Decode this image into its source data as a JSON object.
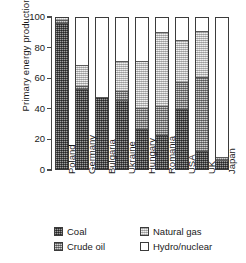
{
  "chart_data": {
    "type": "bar",
    "subtype": "stacked-bar-100",
    "title": "",
    "xlabel": "",
    "ylabel": "Primary energy production (%)",
    "ylim": [
      0,
      100
    ],
    "yticks": [
      0,
      20,
      40,
      60,
      80,
      100
    ],
    "ytick_labels": [
      "0",
      "20",
      "40",
      "60",
      "80",
      "100"
    ],
    "grid": false,
    "legend_position": "bottom",
    "categories": [
      "Poland",
      "Germany",
      "Bulgaria",
      "Ukraine",
      "Hungary",
      "Romania",
      "USA",
      "UK",
      "Japan"
    ],
    "series": [
      {
        "name": "Coal",
        "values": [
          96,
          52,
          47,
          45,
          26,
          22,
          39,
          11,
          5
        ]
      },
      {
        "name": "Crude oil",
        "values": [
          2,
          2,
          0,
          6,
          14,
          19,
          18,
          49,
          2
        ]
      },
      {
        "name": "Natural gas",
        "values": [
          2,
          14,
          0,
          20,
          31,
          49,
          28,
          31,
          0
        ]
      },
      {
        "name": "Hydro/nuclear",
        "values": [
          0,
          32,
          53,
          29,
          29,
          10,
          15,
          9,
          93
        ]
      }
    ],
    "cumulative_tops": {
      "Poland": [
        96,
        98,
        100,
        100
      ],
      "Germany": [
        52,
        54,
        68,
        100
      ],
      "Bulgaria": [
        47,
        47,
        47,
        100
      ],
      "Ukraine": [
        45,
        51,
        71,
        100
      ],
      "Hungary": [
        26,
        40,
        71,
        100
      ],
      "Romania": [
        22,
        41,
        90,
        100
      ],
      "USA": [
        39,
        57,
        85,
        100
      ],
      "UK": [
        11,
        60,
        91,
        100
      ],
      "Japan": [
        5,
        7,
        7,
        100
      ]
    }
  },
  "legend": {
    "entries": [
      {
        "label": "Coal",
        "pattern": "dense-dark-dither",
        "swatch_color": "#545454"
      },
      {
        "label": "Crude oil",
        "pattern": "medium-grey-dither",
        "swatch_color": "#9a9a9a"
      },
      {
        "label": "Natural gas",
        "pattern": "light-grey-dither",
        "swatch_color": "#d8d8d8"
      },
      {
        "label": "Hydro/nuclear",
        "pattern": "open-white",
        "swatch_color": "#ffffff"
      }
    ]
  },
  "axis": {
    "y_title": "Primary energy production (%)",
    "axis_color": "#4a4a4a"
  }
}
